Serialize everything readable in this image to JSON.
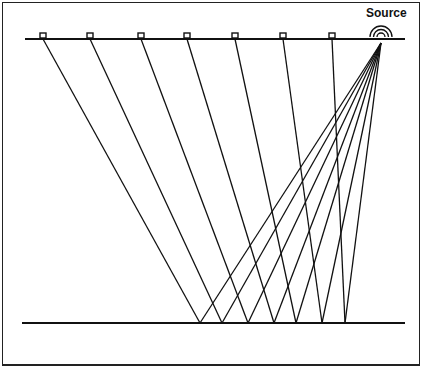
{
  "diagram": {
    "title": "",
    "source_label": "Source",
    "surface": {
      "x1": 25,
      "x2": 405,
      "y": 39
    },
    "reflector": {
      "x1": 22,
      "x2": 405,
      "y": 323
    },
    "source": {
      "x": 381,
      "y": 43
    },
    "receivers": [
      43,
      90,
      141,
      187,
      235,
      283,
      332
    ],
    "reflection_points": [
      200,
      222,
      248,
      274,
      296,
      322,
      345
    ],
    "line_color": "#111111"
  }
}
